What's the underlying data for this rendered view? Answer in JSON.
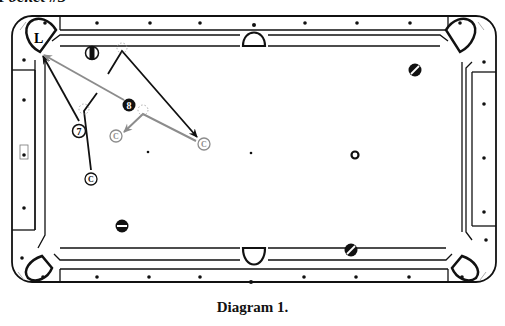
{
  "header": {
    "text": "Pocket #3"
  },
  "caption": {
    "text": "Diagram 1."
  },
  "colors": {
    "line": "#111111",
    "gray_path": "#8c8c8c",
    "ghost": "#999999",
    "background": "#ffffff"
  },
  "table": {
    "outer": {
      "x": 12,
      "y": 16,
      "w": 484,
      "h": 266,
      "r": 20
    },
    "corner_pocket_label": "L",
    "diamonds_top": [
      97,
      150,
      200,
      305,
      357,
      410
    ],
    "diamonds_bottom": [
      97,
      149,
      200,
      304,
      356,
      409
    ],
    "diamonds_left": [
      100,
      155,
      208
    ],
    "diamonds_right": [
      104,
      158,
      212
    ]
  },
  "balls": [
    {
      "id": "ball-7",
      "label": "7",
      "x": 79,
      "y": 131,
      "style": "numbered"
    },
    {
      "id": "ball-8",
      "label": "8",
      "x": 129,
      "y": 105,
      "style": "black-numbered"
    },
    {
      "id": "ball-striped-top",
      "label": "",
      "x": 92,
      "y": 53,
      "style": "stripe-vertical"
    },
    {
      "id": "ball-striped-right",
      "label": "",
      "x": 415,
      "y": 70,
      "style": "stripe-diagonal"
    },
    {
      "id": "ball-striped-bottom-left",
      "label": "",
      "x": 122,
      "y": 226,
      "style": "stripe-horizontal"
    },
    {
      "id": "ball-striped-bottom-right",
      "label": "",
      "x": 351,
      "y": 250,
      "style": "stripe-diagonal"
    },
    {
      "id": "ball-small-center",
      "label": "",
      "x": 355,
      "y": 155,
      "style": "ring"
    }
  ],
  "cue_balls": [
    {
      "id": "cue-1",
      "label": "C",
      "x": 91,
      "y": 179,
      "color": "#111111"
    },
    {
      "id": "cue-2",
      "label": "C",
      "x": 116,
      "y": 136,
      "color": "#8c8c8c"
    },
    {
      "id": "cue-3",
      "label": "C",
      "x": 204,
      "y": 144,
      "color": "#8c8c8c"
    }
  ],
  "spots": [
    {
      "x": 148,
      "y": 152
    },
    {
      "x": 251,
      "y": 153
    }
  ],
  "paths": [
    {
      "id": "path-7-to-pocket",
      "points": [
        [
          79,
          121
        ],
        [
          43,
          56
        ]
      ],
      "color": "#111111",
      "arrow": true
    },
    {
      "id": "path-cue1-up",
      "points": [
        [
          91,
          170
        ],
        [
          84,
          111
        ],
        [
          97,
          93
        ]
      ],
      "color": "#111111",
      "arrow": false
    },
    {
      "id": "path-8-to-pocket",
      "points": [
        [
          124,
          100
        ],
        [
          44,
          55
        ]
      ],
      "color": "#8c8c8c",
      "arrow": true
    },
    {
      "id": "path-cue-bank",
      "points": [
        [
          108,
          74
        ],
        [
          122,
          51
        ],
        [
          197,
          137
        ]
      ],
      "color": "#111111",
      "arrow": true
    },
    {
      "id": "path-cue3-to-8",
      "points": [
        [
          196,
          141
        ],
        [
          143,
          114
        ],
        [
          124,
          132
        ]
      ],
      "color": "#8c8c8c",
      "arrow": true
    }
  ],
  "ghost_balls": [
    {
      "x": 122,
      "y": 51
    },
    {
      "x": 84,
      "y": 112
    },
    {
      "x": 143,
      "y": 113
    }
  ]
}
